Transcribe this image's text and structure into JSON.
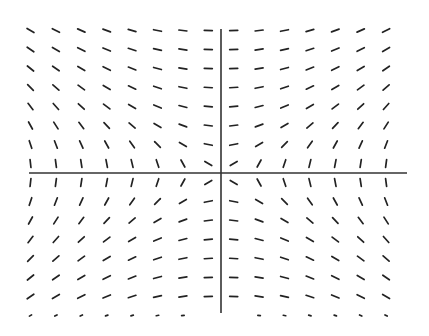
{
  "chart_data": {
    "type": "slope_field",
    "title": "",
    "xlabel": "",
    "ylabel": "",
    "equation_hint": "dy/dx = x / y",
    "grid": false,
    "legend": null,
    "axes": {
      "origin_px": [
        221,
        173
      ],
      "x_axis_px": [
        29,
        407
      ],
      "y_axis_px": [
        29,
        313
      ],
      "color": "#333333"
    },
    "field": {
      "x_values": [
        -7.5,
        -6.5,
        -5.5,
        -4.5,
        -3.5,
        -2.5,
        -1.5,
        -0.5,
        0.5,
        1.5,
        2.5,
        3.5,
        4.5,
        5.5,
        6.5
      ],
      "y_values": [
        7.5,
        6.5,
        5.5,
        4.5,
        3.5,
        2.5,
        1.5,
        0.5,
        -0.5,
        -1.5,
        -2.5,
        -3.5,
        -4.5,
        -5.5,
        -6.5,
        -7.5
      ],
      "x_spacing_px": 25.4,
      "y_spacing_px": 19,
      "segment_length_px": 8,
      "short_row_y": -7.5,
      "short_segment_length_px": 2.5,
      "missing_cells": [
        [
          -0.5,
          -7.5
        ],
        [
          0.5,
          -7.5
        ]
      ],
      "segment_color": "#222222"
    }
  }
}
